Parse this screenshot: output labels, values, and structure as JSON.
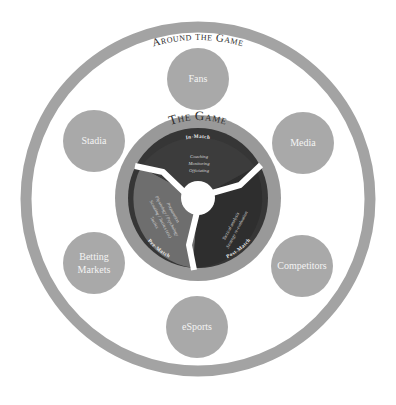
{
  "outer_ring": {
    "title": "Around the Game",
    "color": "#a3a3a3"
  },
  "satellites": [
    {
      "label": "Fans",
      "cx": 198,
      "cy": 79
    },
    {
      "label": "Stadia",
      "cx": 94,
      "cy": 141
    },
    {
      "label": "Media",
      "cx": 303,
      "cy": 143
    },
    {
      "label": "Betting",
      "label2": "Markets",
      "cx": 94,
      "cy": 263
    },
    {
      "label": "Competitors",
      "cx": 302,
      "cy": 266
    },
    {
      "label": "eSports",
      "cx": 197,
      "cy": 327
    }
  ],
  "satellite_color": "#a9a9a9",
  "the_game": {
    "title": "The Game",
    "band_color": "#999999",
    "segments": {
      "in_match": {
        "label": "In-Match",
        "color": "#3a3a3a",
        "items": [
          "Coaching",
          "Monitoring",
          "Officiating"
        ]
      },
      "post_match": {
        "label": "Post-Match",
        "color": "#2f2f2f",
        "items": [
          "Tactical analysis",
          "Strategy re-evaluation"
        ]
      },
      "pre_match": {
        "label": "Pre-Match",
        "color": "#6e6e6e",
        "items": [
          "Preparation",
          "Physiology / Psychology",
          "Scouting / Tactics (etc)",
          "Tactics"
        ]
      }
    }
  }
}
